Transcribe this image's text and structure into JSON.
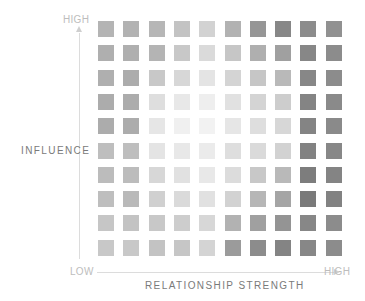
{
  "chart_data": {
    "type": "heatmap",
    "title": "",
    "xlabel": "RELATIONSHIP STRENGTH",
    "ylabel": "INFLUENCE",
    "x_axis": {
      "low_label": "LOW",
      "high_label": "HIGH"
    },
    "y_axis": {
      "low_label": "LOW",
      "high_label": "HIGH"
    },
    "rows": 10,
    "cols": 10,
    "row_order": "top-to-bottom = high-to-low influence",
    "col_order": "left-to-right = low-to-high relationship strength",
    "grid": false,
    "legend": "none",
    "value_encoding": "gray lightness 0-255 (lower = darker)",
    "values": [
      [
        180,
        178,
        182,
        195,
        210,
        178,
        150,
        135,
        140,
        145
      ],
      [
        175,
        175,
        180,
        200,
        218,
        198,
        175,
        160,
        135,
        140
      ],
      [
        175,
        172,
        200,
        215,
        228,
        212,
        198,
        185,
        135,
        140
      ],
      [
        172,
        172,
        222,
        232,
        238,
        225,
        212,
        205,
        132,
        138
      ],
      [
        172,
        172,
        230,
        240,
        242,
        230,
        222,
        215,
        132,
        138
      ],
      [
        190,
        190,
        228,
        232,
        235,
        222,
        218,
        210,
        130,
        135
      ],
      [
        188,
        188,
        215,
        225,
        232,
        220,
        200,
        185,
        125,
        132
      ],
      [
        190,
        185,
        208,
        218,
        225,
        210,
        182,
        165,
        122,
        130
      ],
      [
        198,
        195,
        200,
        205,
        215,
        178,
        160,
        148,
        135,
        140
      ],
      [
        200,
        200,
        195,
        198,
        212,
        155,
        140,
        132,
        135,
        140
      ]
    ]
  },
  "labels": {
    "y_high": "HIGH",
    "y_title": "INFLUENCE",
    "x_low": "LOW",
    "x_high": "HIGH",
    "x_title": "RELATIONSHIP STRENGTH"
  },
  "layout": {
    "cell_size": 16,
    "col_step": 25.3,
    "row_step": 24.3
  }
}
